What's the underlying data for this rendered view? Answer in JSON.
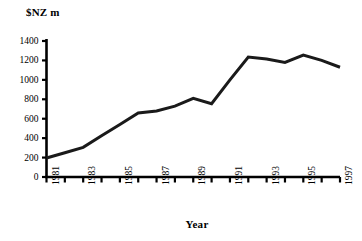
{
  "chart_data": {
    "type": "line",
    "title": "",
    "xlabel": "Year",
    "ylabel": "$NZ m",
    "x": [
      1981,
      1982,
      1983,
      1984,
      1985,
      1986,
      1987,
      1988,
      1989,
      1990,
      1991,
      1992,
      1993,
      1994,
      1995,
      1996,
      1997
    ],
    "values": [
      195,
      250,
      305,
      425,
      540,
      660,
      680,
      730,
      810,
      755,
      1000,
      1235,
      1215,
      1180,
      1255,
      1200,
      1130
    ],
    "series": [
      {
        "name": "$NZ m",
        "values": [
          195,
          250,
          305,
          425,
          540,
          660,
          680,
          730,
          810,
          755,
          1000,
          1235,
          1215,
          1180,
          1255,
          1200,
          1130
        ]
      }
    ],
    "xlim": [
      1981,
      1997
    ],
    "ylim": [
      0,
      1400
    ],
    "y_ticks": [
      0,
      200,
      400,
      600,
      800,
      1000,
      1200,
      1400
    ],
    "x_ticks": [
      1981,
      1982,
      1983,
      1984,
      1985,
      1986,
      1987,
      1988,
      1989,
      1990,
      1991,
      1992,
      1993,
      1994,
      1995,
      1996,
      1997
    ],
    "x_tick_labels": [
      "1981",
      "",
      "1983",
      "",
      "1985",
      "",
      "1987",
      "",
      "1989",
      "",
      "1991",
      "",
      "1993",
      "",
      "1995",
      "",
      "1997"
    ],
    "y_tick_labels": [
      "0",
      "200",
      "400",
      "600",
      "800",
      "1000",
      "1200",
      "1400"
    ],
    "grid": false,
    "legend": false,
    "legend_position": "none",
    "line_color": "#1a1a1a",
    "line_width": 3,
    "axis_color": "#000000",
    "background": "#ffffff",
    "x_tick_label_rotation": 90
  },
  "axes": {
    "y_title": "$NZ m",
    "x_title": "Year"
  }
}
